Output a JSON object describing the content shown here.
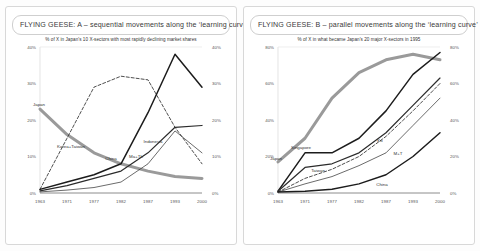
{
  "panels": [
    {
      "title": "FLYING GEESE: A – sequential movements along the ‘learning curve’",
      "name": "panel-a"
    },
    {
      "title": "FLYING GEESE: B – parallel movements along the ‘learning curve’",
      "name": "panel-b"
    }
  ],
  "chart_data": [
    {
      "type": "line",
      "id": "chart-a",
      "title": "% of X in Japan's 10 X-sectors with most rapidly declining market shares",
      "xlabel": "",
      "ylabel": "",
      "x": [
        "1963",
        "1971",
        "1977",
        "1982",
        "1987",
        "1993",
        "2000"
      ],
      "ylim": [
        0,
        40
      ],
      "yticks": [
        "0%",
        "10%",
        "20%",
        "30%",
        "40%"
      ],
      "ytick_values": [
        0,
        10,
        20,
        30,
        40
      ],
      "grid": false,
      "legend": "inline-labels",
      "series": [
        {
          "name": "Japan",
          "values": [
            23,
            16,
            11,
            8,
            6,
            4.5,
            4
          ],
          "style": "thick-grey",
          "color": "#9a9a9a"
        },
        {
          "name": "Korea+Taiwan",
          "values": [
            1,
            15,
            29,
            32,
            31,
            18,
            8
          ],
          "style": "dashed",
          "color": "#3a3a3a"
        },
        {
          "name": "China",
          "values": [
            1,
            3,
            5,
            8,
            22,
            38,
            29
          ],
          "style": "solid-black",
          "color": "#1c1c1c"
        },
        {
          "name": "Ma+Th",
          "values": [
            0.6,
            2,
            4,
            6,
            11,
            18,
            18.5
          ],
          "style": "solid-dark",
          "color": "#2b2b2b"
        },
        {
          "name": "Indonesia",
          "values": [
            0.3,
            0.8,
            1.5,
            3,
            8,
            17,
            11
          ],
          "style": "thin-black",
          "color": "#2b2b2b"
        }
      ]
    },
    {
      "type": "line",
      "id": "chart-b",
      "title": "% of X in what became Japan's 20 major X-sectors in 1995",
      "xlabel": "",
      "ylabel": "",
      "x": [
        "1963",
        "1971",
        "1977",
        "1982",
        "1987",
        "1993",
        "2000"
      ],
      "ylim": [
        0,
        80
      ],
      "yticks": [
        "0%",
        "20%",
        "40%",
        "60%",
        "80%"
      ],
      "ytick_values": [
        0,
        20,
        40,
        60,
        80
      ],
      "grid": false,
      "legend": "inline-labels",
      "series": [
        {
          "name": "Japan",
          "values": [
            17,
            30,
            52,
            66,
            73,
            76,
            73
          ],
          "style": "thick-grey",
          "color": "#9a9a9a"
        },
        {
          "name": "Singapore",
          "values": [
            1,
            22,
            22,
            30,
            45,
            65,
            77
          ],
          "style": "solid-black",
          "color": "#1c1c1c"
        },
        {
          "name": "Taiwan",
          "values": [
            1,
            14,
            16,
            22,
            33,
            48,
            63
          ],
          "style": "solid-dark",
          "color": "#2b2b2b"
        },
        {
          "name": "Ko",
          "values": [
            0.5,
            8,
            13,
            20,
            31,
            45,
            60
          ],
          "style": "dashed",
          "color": "#3a3a3a"
        },
        {
          "name": "M+T",
          "values": [
            0.5,
            5,
            9,
            15,
            22,
            37,
            52
          ],
          "style": "thin-black",
          "color": "#2b2b2b"
        },
        {
          "name": "China",
          "values": [
            0.5,
            1,
            2,
            5,
            10,
            20,
            33
          ],
          "style": "solid-black",
          "color": "#1c1c1c"
        }
      ]
    }
  ]
}
